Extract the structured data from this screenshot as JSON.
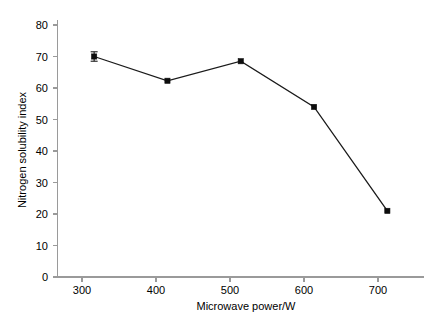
{
  "chart_data": {
    "type": "line",
    "title": "",
    "subtitle": "",
    "xlabel": "Microwave power/W",
    "ylabel": "Nitrogen solubility index",
    "x": [
      300,
      400,
      500,
      600,
      700
    ],
    "values": [
      70,
      62.3,
      68.5,
      54,
      21
    ],
    "errors": [
      1.5,
      0,
      0,
      0,
      0
    ],
    "series": [
      {
        "name": "Nitrogen solubility index",
        "values": [
          70,
          62.3,
          68.5,
          54,
          21
        ]
      }
    ],
    "xlim": [
      250,
      750
    ],
    "ylim": [
      0,
      80
    ],
    "xticks": [
      300,
      400,
      500,
      600,
      700
    ],
    "yticks": [
      0,
      10,
      20,
      30,
      40,
      50,
      60,
      70,
      80
    ],
    "xtick_labels": [
      "300",
      "400",
      "500",
      "600",
      "700"
    ],
    "ytick_labels": [
      "0",
      "10",
      "20",
      "30",
      "40",
      "50",
      "60",
      "70",
      "80"
    ],
    "grid": false,
    "legend": false,
    "legend_position": "none",
    "marker": "square",
    "line_color": "#1a1a1a",
    "marker_color": "#0d0d0d",
    "axis_color": "#9a9a9a",
    "background_color": "#ffffff"
  },
  "axes": {
    "x_title": "Microwave power/W",
    "y_title": "Nitrogen solubility index"
  },
  "ticks": {
    "y": [
      {
        "label": "80",
        "value": 80
      },
      {
        "label": "70",
        "value": 70
      },
      {
        "label": "60",
        "value": 60
      },
      {
        "label": "50",
        "value": 50
      },
      {
        "label": "40",
        "value": 40
      },
      {
        "label": "30",
        "value": 30
      },
      {
        "label": "20",
        "value": 20
      },
      {
        "label": "10",
        "value": 10
      },
      {
        "label": "0",
        "value": 0
      }
    ],
    "x": [
      {
        "label": "300",
        "value": 300
      },
      {
        "label": "400",
        "value": 400
      },
      {
        "label": "500",
        "value": 500
      },
      {
        "label": "600",
        "value": 600
      },
      {
        "label": "700",
        "value": 700
      }
    ]
  }
}
